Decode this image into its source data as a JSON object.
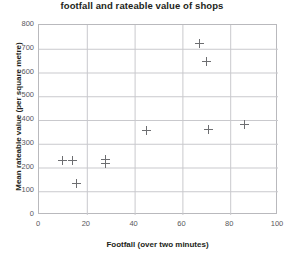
{
  "chart_data": {
    "type": "scatter",
    "title": "footfall and rateable value of shops",
    "xlabel": "Footfall (over two minutes)",
    "ylabel": "Mean rateable value (per square metre)",
    "xlim": [
      0,
      100
    ],
    "ylim": [
      0,
      800
    ],
    "xticks": [
      0,
      20,
      40,
      60,
      80,
      100
    ],
    "yticks": [
      0,
      100,
      200,
      300,
      400,
      500,
      600,
      700,
      800
    ],
    "xtick_labels": [
      "0",
      "20",
      "40",
      "60",
      "80",
      "100"
    ],
    "ytick_labels": [
      "0",
      "100",
      "200",
      "300",
      "400",
      "500",
      "600",
      "700",
      "800"
    ],
    "grid": true,
    "legend": null,
    "marker": "plus",
    "marker_color": "#6d6e71",
    "points": [
      {
        "x": 10,
        "y": 228
      },
      {
        "x": 14,
        "y": 228
      },
      {
        "x": 15.5,
        "y": 133
      },
      {
        "x": 28,
        "y": 232
      },
      {
        "x": 28,
        "y": 218
      },
      {
        "x": 45,
        "y": 355
      },
      {
        "x": 67,
        "y": 722
      },
      {
        "x": 70,
        "y": 645
      },
      {
        "x": 71,
        "y": 358
      },
      {
        "x": 86,
        "y": 383
      }
    ]
  },
  "colors": {
    "frame": "#b9b9bd",
    "gridline": "#c9c9cd",
    "text": "#231f20",
    "tick_text": "#58585b",
    "marker": "#6d6e71",
    "background": "#ffffff"
  }
}
